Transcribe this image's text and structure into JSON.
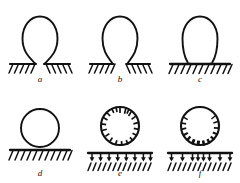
{
  "figure": {
    "type": "diagram",
    "columns": 3,
    "rows": 2,
    "background_color": "#ffffff",
    "ink_color": "#111111",
    "panels": [
      {
        "id": "a",
        "label": "a",
        "shape": "circle-with-narrow-neck",
        "contact_width": "narrow",
        "surface": "hatched-line",
        "hatch_direction": "mirrored",
        "ticks": "none",
        "arrow_row": false
      },
      {
        "id": "b",
        "label": "b",
        "shape": "circle-with-small-contact",
        "contact_width": "small",
        "surface": "hatched-line",
        "hatch_direction": "mirrored",
        "ticks": "none",
        "arrow_row": false
      },
      {
        "id": "c",
        "label": "c",
        "shape": "circle-with-flat-base",
        "contact_width": "wide",
        "surface": "hatched-line-thick-contact",
        "hatch_direction": "left",
        "ticks": "none",
        "arrow_row": false
      },
      {
        "id": "d",
        "label": "d",
        "shape": "circle-tangent",
        "contact_width": "point",
        "surface": "hatched-line",
        "hatch_direction": "left",
        "ticks": "none",
        "arrow_row": false
      },
      {
        "id": "e",
        "label": "e",
        "shape": "circle-with-radial-ticks",
        "contact_width": "none",
        "surface": "hatched-line",
        "hatch_direction": "left",
        "ticks": "uniform-radial-inward",
        "tick_count": 20,
        "arrow_row": true,
        "arrow_count": 8,
        "arrow_direction": "down",
        "arrow_spacing": "even"
      },
      {
        "id": "f",
        "label": "f",
        "shape": "circle-with-asymmetric-ticks",
        "contact_width": "none",
        "surface": "hatched-line",
        "hatch_direction": "left",
        "ticks": "asymmetric-bottom-heavy",
        "tick_count": 20,
        "arrow_row": true,
        "arrow_count": 8,
        "arrow_direction": "down",
        "arrow_spacing": "uneven"
      }
    ]
  }
}
